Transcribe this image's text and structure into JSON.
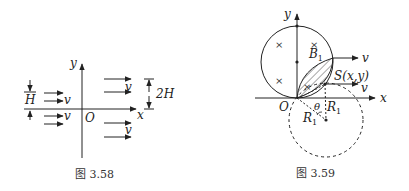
{
  "figure_left": {
    "caption": "图 3.58",
    "labels": {
      "y_axis": "y",
      "x_axis": "x",
      "origin": "O",
      "height_H": "H",
      "height_2H": "2H",
      "v1": "v",
      "v2": "v",
      "v3": "v",
      "v4": "v"
    }
  },
  "figure_right": {
    "caption": "图 3.59",
    "labels": {
      "y_axis": "y",
      "x_axis": "x",
      "origin": "O",
      "field": "B",
      "field_sub": "1",
      "point_S": "S(x,y)",
      "v_top": "v",
      "v_mid": "v",
      "theta": "θ",
      "radius_a": "R",
      "radius_a_sub": "1",
      "radius_b": "R",
      "radius_b_sub": "1"
    }
  },
  "colors": {
    "ink": "#222222",
    "background": "#ffffff"
  }
}
